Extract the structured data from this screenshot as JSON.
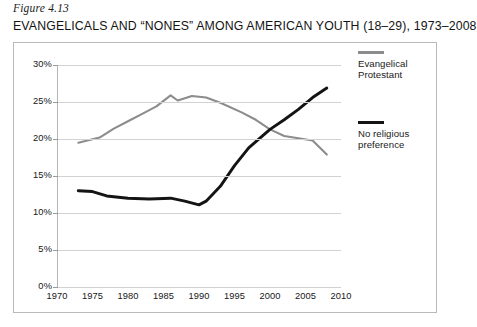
{
  "figure": {
    "caption": "Figure 4.13",
    "title": "EVANGELICALS AND “NONES” AMONG AMERICAN YOUTH (18–29), 1973–2008"
  },
  "colors": {
    "evangelical_line": "#8c8c8c",
    "nones_line": "#141414",
    "gridline": "#d2d2d2",
    "frame_border": "#b9b9b9",
    "text": "#161616",
    "background": "#ffffff"
  },
  "legend": {
    "position": "right",
    "entries": [
      {
        "label": "Evangelical\nProtestant",
        "label_line1": "Evangelical",
        "label_line2": "Protestant",
        "color": "#8c8c8c",
        "swatch": "gray-line-swatch"
      },
      {
        "label": "No religious\npreference",
        "label_line1": "No religious",
        "label_line2": "preference",
        "color": "#141414",
        "swatch": "black-line-swatch"
      }
    ]
  },
  "axes": {
    "y": {
      "label": "",
      "min": 0,
      "max": 30,
      "step": 5,
      "tick_labels": [
        "30%",
        "25%",
        "20%",
        "15%",
        "10%",
        "5%",
        "0%"
      ],
      "tick_values": [
        30,
        25,
        20,
        15,
        10,
        5,
        0
      ],
      "grid": true
    },
    "x": {
      "label": "",
      "min": 1970,
      "max": 2010,
      "step": 5,
      "tick_labels": [
        "1970",
        "1975",
        "1980",
        "1985",
        "1990",
        "1995",
        "2000",
        "2005",
        "2010"
      ],
      "tick_values": [
        1970,
        1975,
        1980,
        1985,
        1990,
        1995,
        2000,
        2005,
        2010
      ],
      "grid": false
    }
  },
  "chart_data": {
    "type": "line",
    "title": "EVANGELICALS AND “NONES” AMONG AMERICAN YOUTH (18–29), 1973–2008",
    "subtitle": "Figure 4.13",
    "xlabel": "",
    "ylabel": "",
    "xlim": [
      1970,
      2010
    ],
    "ylim": [
      0,
      30
    ],
    "yunit": "percent",
    "grid": true,
    "legend_position": "right",
    "series": [
      {
        "name": "Evangelical Protestant",
        "color": "#8c8c8c",
        "x": [
          1973,
          1976,
          1978,
          1980,
          1982,
          1984,
          1986,
          1987,
          1989,
          1991,
          1993,
          1996,
          1998,
          2000,
          2002,
          2004,
          2006,
          2008
        ],
        "values": [
          19.5,
          20.2,
          21.4,
          22.4,
          23.4,
          24.4,
          25.9,
          25.2,
          25.8,
          25.6,
          24.9,
          23.6,
          22.6,
          21.3,
          20.4,
          20.1,
          19.8,
          17.9
        ]
      },
      {
        "name": "No religious preference",
        "color": "#141414",
        "x": [
          1973,
          1975,
          1977,
          1980,
          1983,
          1986,
          1988,
          1990,
          1991,
          1993,
          1995,
          1997,
          2000,
          2002,
          2004,
          2006,
          2008
        ],
        "values": [
          13.0,
          12.9,
          12.3,
          12.0,
          11.9,
          12.0,
          11.6,
          11.1,
          11.6,
          13.6,
          16.4,
          18.8,
          21.3,
          22.6,
          24.0,
          25.6,
          26.9
        ]
      }
    ],
    "annotations": [
      {
        "text": "crossover",
        "x": 2000,
        "y": 21.3,
        "visible": false
      }
    ]
  }
}
